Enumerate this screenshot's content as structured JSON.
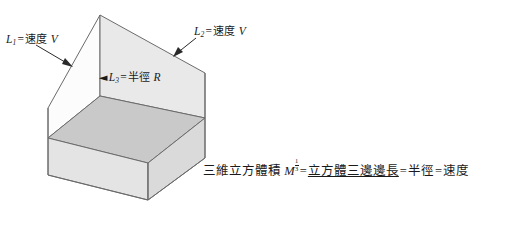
{
  "figure": {
    "type": "isometric-open-cube-diagram",
    "background_color": "#ffffff",
    "stroke_color": "#5a5a5a",
    "face_colors": {
      "inner_back_left": "#fcfcfc",
      "inner_back_right": "#e8e8e8",
      "inner_floor": "#c9c9c9",
      "outer_front_left": "#e4e4e4",
      "outer_front_right": "#d6d6d6"
    }
  },
  "labels": {
    "l1": {
      "symbol": "L",
      "subscript": "1",
      "equals": "=",
      "term": "速度",
      "value": "V",
      "arrow": "arrow-down-right"
    },
    "l2": {
      "symbol": "L",
      "subscript": "2",
      "equals": "=",
      "term": "速度",
      "value": "V",
      "arrow": "arrow-down-left"
    },
    "l3": {
      "symbol": "L",
      "subscript": "3",
      "equals": "=",
      "term": "半徑",
      "value": "R",
      "arrow_glyph": "◄",
      "arrow": "arrow-left"
    }
  },
  "caption": {
    "lead": "三維立方體積",
    "symbol": "M",
    "exponent_numerator": "1",
    "exponent_denominator": "3",
    "equals_1": "=",
    "term_1": "立方體三邊邊長",
    "equals_2": "=",
    "term_2": "半徑",
    "equals_3": "=",
    "term_3": "速度",
    "full_text": "三維立方體積 M^(1/3) = 立方體三邊邊長 = 半徑 = 速度"
  }
}
